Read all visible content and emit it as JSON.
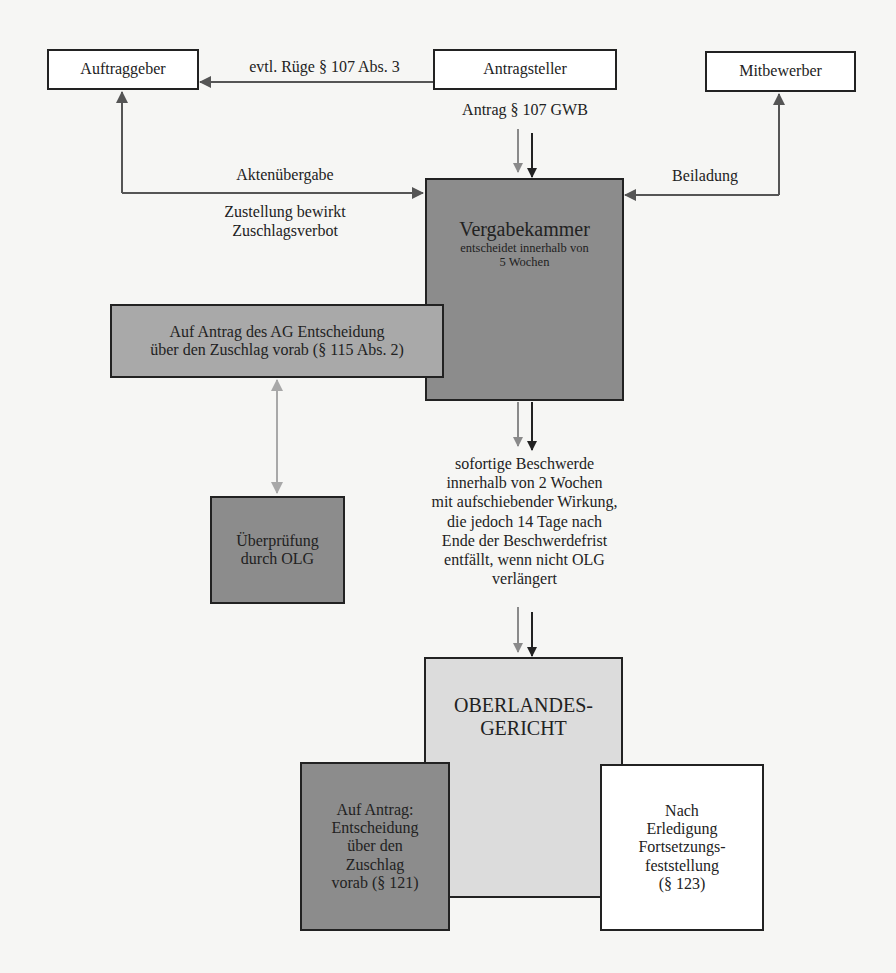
{
  "nodes": {
    "auftraggeber": "Auftraggeber",
    "antragsteller": "Antragsteller",
    "mitbewerber": "Mitbewerber",
    "vergabekammer": {
      "title": "Vergabekammer",
      "line1": "entscheidet innerhalb von",
      "line2": "5 Wochen"
    },
    "vorab_ag": {
      "line1": "Auf Antrag des AG Entscheidung",
      "line2": "über den Zuschlag vorab (§ 115 Abs. 2)"
    },
    "ueberpruefung": {
      "line1": "Überprüfung",
      "line2": "durch OLG"
    },
    "olg": {
      "line1": "OBERLANDES-",
      "line2": "GERICHT"
    },
    "vorab_121": {
      "line1": "Auf Antrag:",
      "line2": "Entscheidung",
      "line3": "über den",
      "line4": "Zuschlag",
      "line5": "vorab (§ 121)"
    },
    "fortsetzung": {
      "line1": "Nach",
      "line2": "Erledigung",
      "line3": "Fortsetzungs-",
      "line4": "feststellung",
      "line5": "(§ 123)"
    }
  },
  "edges": {
    "ruege": "evtl. Rüge § 107 Abs. 3",
    "antrag": "Antrag § 107 GWB",
    "aktenuebergabe": "Aktenübergabe",
    "zustellung_line1": "Zustellung bewirkt",
    "zustellung_line2": "Zuschlagsverbot",
    "beiladung": "Beiladung",
    "beschwerde": [
      "sofortige Beschwerde",
      "innerhalb von 2 Wochen",
      "mit aufschiebender Wirkung,",
      "die jedoch 14 Tage nach",
      "Ende der Beschwerdefrist",
      "entfällt, wenn nicht OLG",
      "verlängert"
    ]
  },
  "colors": {
    "dark_box": "#8c8c8c",
    "mid_box": "#a9a9a9",
    "light_box": "#dcdcdc",
    "arrow_dark": "#222222",
    "arrow_gray": "#8a8a8a",
    "arrow_light": "#a8a8a8"
  }
}
